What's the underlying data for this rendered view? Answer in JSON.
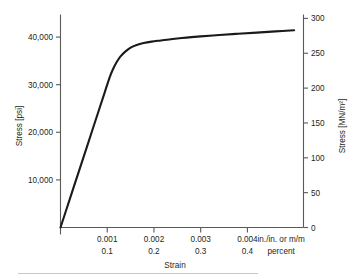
{
  "chart_data": {
    "type": "line",
    "title": "",
    "xlabel": "Strain",
    "ylabel": "Stress [psi]",
    "ylabel_right": "Stress [MN/m²]",
    "grid": false,
    "legend": "none",
    "xlim": [
      0,
      0.0052
    ],
    "ylim": [
      0,
      44500
    ],
    "ylim_right": [
      0,
      316
    ],
    "x_unit_primary": "in./in. or m/m",
    "x_unit_secondary": "percent",
    "x_ticks_primary": [
      "0.001",
      "0.002",
      "0.003",
      "0.004"
    ],
    "x_ticks_primary_values": [
      0.001,
      0.002,
      0.003,
      0.004
    ],
    "x_ticks_secondary": [
      "0.1",
      "0.2",
      "0.3",
      "0.4"
    ],
    "x_ticks_secondary_values": [
      0.1,
      0.2,
      0.3,
      0.4
    ],
    "y_ticks_left": [
      "10,000",
      "20,000",
      "30,000",
      "40,000"
    ],
    "y_ticks_left_values": [
      10000,
      20000,
      30000,
      40000
    ],
    "y_ticks_right": [
      "0",
      "50",
      "100",
      "150",
      "200",
      "250",
      "300"
    ],
    "y_ticks_right_values": [
      0,
      50,
      100,
      150,
      200,
      250,
      300
    ],
    "series": [
      {
        "name": "stress-strain curve",
        "color": "#1a1a1a",
        "x": [
          0,
          0.0002,
          0.0004,
          0.0006,
          0.0008,
          0.00095,
          0.00105,
          0.00112,
          0.0012,
          0.00128,
          0.00138,
          0.0015,
          0.00163,
          0.00178,
          0.00195,
          0.00215,
          0.0024,
          0.0027,
          0.003,
          0.0034,
          0.0038,
          0.0042,
          0.0046,
          0.005
        ],
        "y": [
          0,
          6000,
          12000,
          18000,
          24000,
          28500,
          31500,
          33200,
          34700,
          35900,
          36900,
          37800,
          38350,
          38750,
          39050,
          39300,
          39600,
          39900,
          40150,
          40450,
          40700,
          40950,
          41200,
          41450
        ]
      }
    ]
  },
  "axes": {
    "left_title": "Stress [psi]",
    "right_title": "Stress [MN/m²]",
    "bottom_title": "Strain"
  }
}
